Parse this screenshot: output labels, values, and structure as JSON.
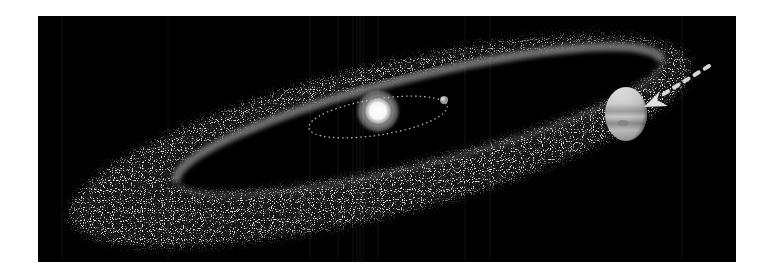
{
  "scene": {
    "description": "Illustration of a debris/asteroid belt around a star with an inner planet orbit and Jupiter with an inward migration arrow",
    "background_color": "#000000",
    "page_color": "#ffffff",
    "panel": {
      "x": 38,
      "y": 16,
      "width": 698,
      "height": 246
    },
    "colors": {
      "belt_dust": "#c8c8c8",
      "belt_inner_band": "#bdbdbd",
      "star": "#ffffff",
      "orbit": "#cfcfcf",
      "arrow": "#d9d9d9",
      "jupiter_light": "#e6e6e6",
      "jupiter_dark": "#8a8a8a"
    }
  },
  "objects": {
    "star": {
      "label": "Sun",
      "cx": 340,
      "cy": 95,
      "r": 15
    },
    "inner_orbit": {
      "label": "inner planet orbit",
      "cx": 340,
      "cy": 101,
      "rx": 70,
      "ry": 18,
      "rotate": -9
    },
    "inner_planet": {
      "label": "inner planet",
      "cx": 406,
      "cy": 84,
      "r": 4
    },
    "belt": {
      "label": "debris belt",
      "cx": 342,
      "cy": 125,
      "rx": 320,
      "ry": 75,
      "rotate": -14
    },
    "belt_hole": {
      "cx": 380,
      "cy": 101,
      "rx": 255,
      "ry": 44,
      "rotate": -14
    },
    "jupiter": {
      "label": "Jupiter",
      "cx": 588,
      "cy": 98,
      "rx": 21,
      "ry": 27
    },
    "migration_arrow": {
      "label": "migration arrow",
      "from": [
        671,
        50
      ],
      "to": [
        609,
        88
      ]
    }
  }
}
